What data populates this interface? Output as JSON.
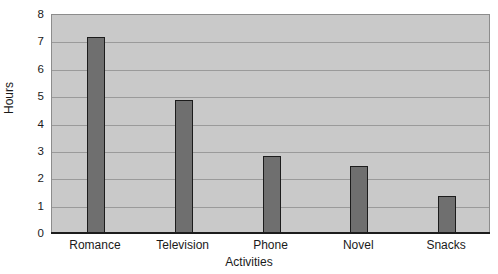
{
  "chart_data": {
    "type": "bar",
    "title": "",
    "xlabel": "Activities",
    "ylabel": "Hours",
    "categories": [
      "Romance",
      "Television",
      "Phone",
      "Novel",
      "Snacks"
    ],
    "values": [
      7.2,
      4.9,
      2.85,
      2.5,
      1.4
    ],
    "series": [
      {
        "name": "Hours",
        "values": [
          7.2,
          4.9,
          2.85,
          2.5,
          1.4
        ]
      }
    ],
    "ylim": [
      0,
      8
    ],
    "ytick_labels": [
      "8",
      "7",
      "6",
      "5",
      "4",
      "3",
      "2",
      "1",
      "0"
    ],
    "ytick_values": [
      8,
      7,
      6,
      5,
      4,
      3,
      2,
      1,
      0
    ],
    "grid": true,
    "grid_axis": "y",
    "legend": false,
    "legend_position": "none",
    "colors": {
      "bar_fill": "#6f6f6f",
      "bar_border": "#1c1c1c",
      "plot_background": "#c9c9c9",
      "gridline": "#9a9a9a",
      "axis_line": "#1c1c1c",
      "text": "#1a1a1a",
      "page_background": "#ffffff"
    }
  }
}
